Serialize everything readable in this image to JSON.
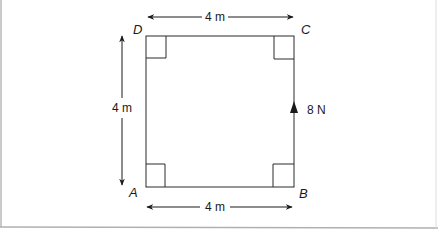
{
  "diagram": {
    "type": "square-force-diagram",
    "colors": {
      "line": "#2a2a2a",
      "frame": "#b0b0b0",
      "background": "#ffffff"
    },
    "vertices": {
      "A": {
        "label": "A"
      },
      "B": {
        "label": "B"
      },
      "C": {
        "label": "C"
      },
      "D": {
        "label": "D"
      }
    },
    "dimensions": {
      "top": {
        "label": "4 m"
      },
      "bottom": {
        "label": "4 m"
      },
      "left": {
        "label": "4 m"
      }
    },
    "force": {
      "label": "8 N",
      "side": "BC",
      "direction": "up"
    },
    "right_angles": [
      "A",
      "B",
      "C",
      "D"
    ]
  }
}
